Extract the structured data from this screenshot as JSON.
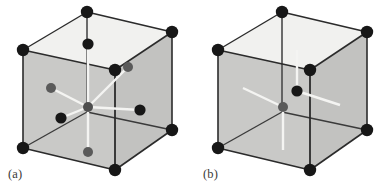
{
  "figure": {
    "background_color": "#ffffff",
    "panel_count": 2
  },
  "style": {
    "top_face_color": "#f1f1ef",
    "left_face_color": "#c9c9c7",
    "right_face_color": "#c2c2c0",
    "bottom_face_color": "#cfcfcd",
    "edge_color": "#2b2b2b",
    "hidden_edge_color": "#4a4a4a",
    "bond_color": "#f4f4f2",
    "atom_black": "#171717",
    "atom_gray": "#5a5a5a",
    "caption_color": "#3a3a38"
  },
  "panels": [
    {
      "id": "a",
      "caption": "(a)",
      "caption_x": 8,
      "caption_y": 168,
      "cube": {
        "vertices": {
          "top_back_left": [
            23,
            50
          ],
          "top_back_top": [
            87,
            12
          ],
          "top_back_right": [
            172,
            32
          ],
          "top_front_center": [
            115,
            70
          ],
          "bottom_front_left": [
            23,
            148
          ],
          "bottom_front_center": [
            115,
            170
          ],
          "bottom_back_right": [
            172,
            130
          ],
          "bottom_back_top": [
            87,
            112
          ]
        },
        "corner_atom_count": 8,
        "corner_atom_radius": 6.2,
        "interior_atoms": [
          {
            "label": "center",
            "x": 88,
            "y": 107,
            "color": "gray",
            "radius": 5.0
          },
          {
            "label": "top",
            "x": 88,
            "y": 44,
            "color": "black",
            "radius": 5.6
          },
          {
            "label": "bottom",
            "x": 88,
            "y": 152,
            "color": "gray",
            "radius": 5.0
          },
          {
            "label": "left",
            "x": 51,
            "y": 88,
            "color": "gray",
            "radius": 5.0
          },
          {
            "label": "right",
            "x": 140,
            "y": 110,
            "color": "black",
            "radius": 5.6
          },
          {
            "label": "front-left",
            "x": 61,
            "y": 118,
            "color": "black",
            "radius": 5.6
          },
          {
            "label": "back-right",
            "x": 128,
            "y": 67,
            "color": "gray",
            "radius": 5.0
          }
        ],
        "bond_count": 6,
        "coordination": "octahedral"
      }
    },
    {
      "id": "b",
      "caption": "(b)",
      "caption_x": 8,
      "caption_y": 168,
      "cube": {
        "vertices": {
          "top_back_left": [
            23,
            50
          ],
          "top_back_top": [
            87,
            12
          ],
          "top_back_right": [
            172,
            32
          ],
          "top_front_center": [
            115,
            70
          ],
          "bottom_front_left": [
            23,
            148
          ],
          "bottom_front_center": [
            115,
            170
          ],
          "bottom_back_right": [
            172,
            130
          ],
          "bottom_back_top": [
            87,
            112
          ]
        },
        "corner_atom_count": 8,
        "corner_atom_radius": 6.2,
        "interior_atoms": [
          {
            "label": "center",
            "x": 88,
            "y": 107,
            "color": "gray",
            "radius": 5.0
          },
          {
            "label": "upper-right",
            "x": 102,
            "y": 91,
            "color": "black",
            "radius": 5.6
          }
        ],
        "bond_count": 3,
        "coordination": "simple"
      }
    }
  ]
}
